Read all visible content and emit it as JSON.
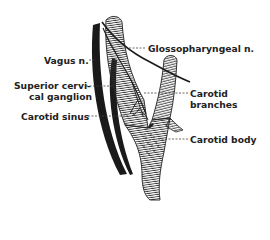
{
  "figure": {
    "type": "anatomical-diagram",
    "labels": {
      "glossopharyngeal": "Glossopharyngeal n.",
      "vagus": "Vagus n.",
      "superior_ganglion_line1": "Superior cervi-",
      "superior_ganglion_line2": "cal ganglion",
      "carotid_sinus": "Carotid sinus",
      "carotid_branches_line1": "Carotid",
      "carotid_branches_line2": "branches",
      "carotid_body": "Carotid body"
    },
    "caption": "",
    "colors": {
      "ink": "#222222",
      "background": "#ffffff"
    }
  }
}
